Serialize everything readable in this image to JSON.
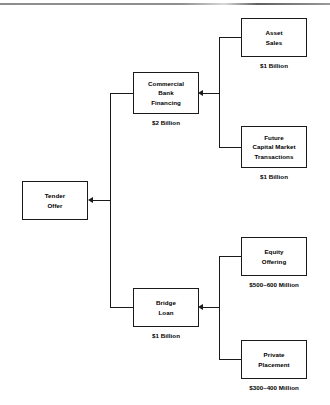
{
  "diagram": {
    "nodes": [
      {
        "id": "tender-offer",
        "label": "Tender\nOffer",
        "caption": ""
      },
      {
        "id": "commercial-bank",
        "label": "Commercial\nBank\nFinancing",
        "caption": "$2 Billion"
      },
      {
        "id": "bridge-loan",
        "label": "Bridge\nLoan",
        "caption": "$1 Billion"
      },
      {
        "id": "asset-sales",
        "label": "Asset\nSales",
        "caption": "$1 Billion"
      },
      {
        "id": "future-capital-market",
        "label": "Future\nCapital Market\nTransactions",
        "caption": "$1 Billion"
      },
      {
        "id": "equity-offering",
        "label": "Equity\nOffering",
        "caption": "$500–600 Million"
      },
      {
        "id": "private-placement",
        "label": "Private\nPlacement",
        "caption": "$300–400 Million"
      }
    ],
    "colors": {
      "line": "#1a1a1a",
      "box_fill": "#ffffff",
      "text": "#000000",
      "rule": "#8d8d8d"
    }
  }
}
